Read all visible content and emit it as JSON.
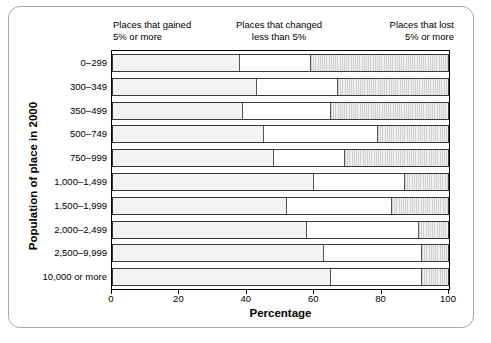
{
  "chart_data": {
    "type": "bar",
    "orientation": "horizontal",
    "stacked": true,
    "title": "",
    "xlabel": "Percentage",
    "ylabel": "Population of place in 2000",
    "xlim": [
      0,
      100
    ],
    "xticks": [
      0,
      20,
      40,
      60,
      80,
      100
    ],
    "grid": false,
    "legend_position": "top",
    "legend": [
      "Places that gained\n5% or more",
      "Places that changed\nless than 5%",
      "Places that lost\n5% or more"
    ],
    "categories": [
      "0–299",
      "300–349",
      "350–499",
      "500–749",
      "750–999",
      "1,000–1,499",
      "1,500–1,999",
      "2,000–2,499",
      "2,500–9,999",
      "10,000 or more"
    ],
    "series": [
      {
        "name": "Places that gained 5% or more",
        "values": [
          38,
          43,
          39,
          45,
          48,
          60,
          52,
          58,
          63,
          65
        ]
      },
      {
        "name": "Places that changed less than 5%",
        "values": [
          21,
          24,
          26,
          34,
          21,
          27,
          31,
          33,
          29,
          27
        ]
      },
      {
        "name": "Places that lost 5% or more",
        "values": [
          41,
          33,
          35,
          21,
          31,
          13,
          17,
          9,
          8,
          8
        ]
      }
    ],
    "cumulative_boundaries": [
      [
        38,
        59
      ],
      [
        43,
        67
      ],
      [
        39,
        65
      ],
      [
        45,
        79
      ],
      [
        48,
        69
      ],
      [
        60,
        87
      ],
      [
        52,
        83
      ],
      [
        58,
        91
      ],
      [
        63,
        92
      ],
      [
        65,
        92
      ]
    ]
  },
  "colors": {
    "segment_gained": "#f2f2f2",
    "segment_changed": "#ffffff",
    "segment_lost": "#e4e4e4",
    "frame": "#a8a8a8",
    "axis": "#000000"
  }
}
